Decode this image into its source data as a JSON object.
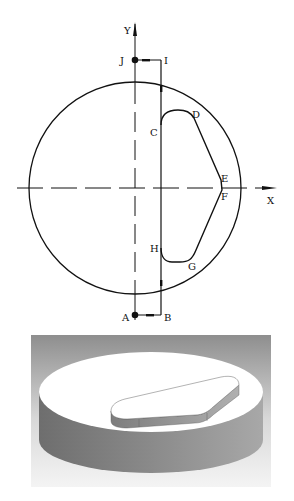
{
  "plan_view": {
    "axes": {
      "x_label": "X",
      "y_label": "Y"
    },
    "points": {
      "A": "A",
      "B": "B",
      "C": "C",
      "D": "D",
      "E": "E",
      "F": "F",
      "G": "G",
      "H": "H",
      "I": "I",
      "J": "J"
    },
    "colors": {
      "line": "#111111",
      "background": "#ffffff"
    }
  },
  "iso_view": {
    "colors": {
      "background_top": "#8e8e8e",
      "background_bottom": "#f4f4f4",
      "top_face": "#ffffff",
      "side_face": "#7a7a7a",
      "boss_side": "#9a9a9a"
    }
  }
}
